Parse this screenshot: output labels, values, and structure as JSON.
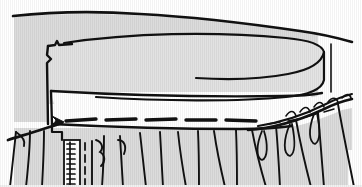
{
  "figure": {
    "title": "Waistband applied to gathered skirt",
    "type": "line-art-illustration",
    "width": 362,
    "height": 187,
    "medium": "scanned pen-and-ink technical sewing diagram",
    "background_color": "#ffffff",
    "fabric_fill_color": "#dcdcdc",
    "band_face_color": "#ffffff",
    "ink_color": "#111111",
    "scan_artifact": "faint vertical scan striping over the shaded areas"
  },
  "parts": [
    {
      "id": "upper-fabric-panel",
      "label": "Upper fabric panel",
      "description": "Large shaded field filling the top of the frame, bounded above by a hand-drawn slightly downward-sloping edge line",
      "fill": "#dcdcdc"
    },
    {
      "id": "waistband-cylinder",
      "label": "Waistband cylinder",
      "description": "Rolled waistband drawn as a cylinder whose right end is an ellipse, shaded light gray",
      "fill": "#e2e2e2"
    },
    {
      "id": "waistband-facing",
      "label": "Waistband facing",
      "description": "White rectangular band below the cylinder, outlined in dark ink, open to the right",
      "fill": "#ffffff"
    },
    {
      "id": "gathered-skirt",
      "label": "Gathered skirt",
      "description": "Lower shaded field broken by many vertical and radiating fold lines indicating gathers",
      "fill": "#dcdcdc"
    },
    {
      "id": "basting-stitch-line",
      "label": "Basting stitch line",
      "description": "Horizontal row of heavy dashes running across the join between band and skirt"
    },
    {
      "id": "gathering-stitch-line",
      "label": "Gathering stitch line",
      "description": "Thin dashed line continuing to the right across the gathered edge"
    },
    {
      "id": "zipper",
      "label": "Zipper",
      "description": "Short vertical zipper with coil teeth and an adjacent dashed topstitching line at the lower left"
    },
    {
      "id": "pointer-arrow",
      "label": "Pointer arrow",
      "description": "Hand-drawn arrow at the left pointing up and to the right toward the stitch line"
    }
  ],
  "annotations": {
    "arrow_direction": "up-right",
    "arrow_target": "basting-stitch-line",
    "visible_text": ""
  }
}
